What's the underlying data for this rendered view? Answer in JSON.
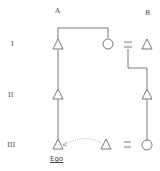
{
  "columns": [
    {
      "id": "A",
      "label": "A"
    },
    {
      "id": "B",
      "label": "B"
    }
  ],
  "generations": [
    {
      "id": "I",
      "label": "I"
    },
    {
      "id": "II",
      "label": "II"
    },
    {
      "id": "III",
      "label": "III"
    }
  ],
  "ego_label": "Ego",
  "equals_symbol": "=",
  "symbols": {
    "male": "triangle",
    "female": "circle",
    "marriage": "equals"
  },
  "nodes": [
    {
      "id": "A-I-male",
      "shape": "triangle",
      "generation": "I",
      "column": "A"
    },
    {
      "id": "A-I-female",
      "shape": "circle",
      "generation": "I"
    },
    {
      "id": "B-I-male",
      "shape": "triangle",
      "generation": "I",
      "column": "B"
    },
    {
      "id": "A-II-male",
      "shape": "triangle",
      "generation": "II",
      "column": "A"
    },
    {
      "id": "B-II-male",
      "shape": "triangle",
      "generation": "II",
      "column": "B"
    },
    {
      "id": "A-III-ego",
      "shape": "triangle",
      "generation": "III",
      "column": "A",
      "label": "Ego"
    },
    {
      "id": "III-male",
      "shape": "triangle",
      "generation": "III"
    },
    {
      "id": "B-III-female",
      "shape": "circle",
      "generation": "III",
      "column": "B"
    }
  ],
  "colors": {
    "line": "#555555",
    "dashed": "#aaaaaa",
    "text": "#444444",
    "background": "#ffffff"
  }
}
